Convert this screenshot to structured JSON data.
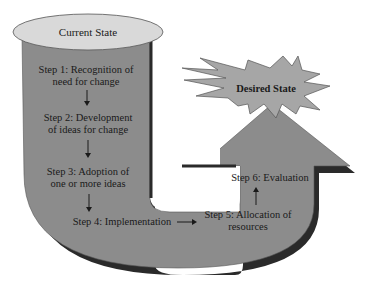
{
  "diagram": {
    "start": {
      "label": "Current State"
    },
    "goal": {
      "label": "Desired State"
    },
    "steps": [
      {
        "lines": [
          "Step 1: Recognition of",
          "need for change"
        ]
      },
      {
        "lines": [
          "Step 2: Development",
          "of ideas for change"
        ]
      },
      {
        "lines": [
          "Step 3: Adoption of",
          "one or more ideas"
        ]
      },
      {
        "lines": [
          "Step 4: Implementation"
        ]
      },
      {
        "lines": [
          "Step 5: Allocation of",
          "resources"
        ]
      },
      {
        "lines": [
          "Step 6: Evaluation"
        ]
      }
    ],
    "colors": {
      "path_fill": "#8c8c8c",
      "path_shadow": "#2a2a2a",
      "ellipse_fill": "#d9d9d9",
      "star_fill": "#a6a6a6",
      "text": "#1a1a1a"
    }
  }
}
